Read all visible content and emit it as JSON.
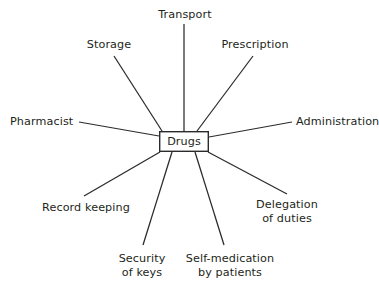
{
  "diagram": {
    "type": "spider-diagram",
    "title": "Drugs",
    "background_color": "#ffffff",
    "line_color": "#2b2b2b",
    "text_color": "#231f20",
    "center": {
      "label": "Drugs",
      "shape": "rectangle",
      "box": {
        "x": 159,
        "y": 131,
        "width": 50,
        "height": 21
      }
    },
    "spokes": [
      {
        "id": "transport",
        "label": "Transport",
        "lines": [
          "Transport"
        ],
        "direction": "top",
        "label_pos": {
          "x": 155,
          "y": 8,
          "width": 60,
          "align": "center"
        },
        "connector": {
          "x1": 184,
          "y1": 24,
          "x2": 184,
          "y2": 131
        }
      },
      {
        "id": "storage",
        "label": "Storage",
        "lines": [
          "Storage"
        ],
        "direction": "top-left",
        "label_pos": {
          "x": 83,
          "y": 38,
          "width": 52,
          "align": "center"
        },
        "connector": {
          "x1": 114,
          "y1": 56,
          "x2": 162,
          "y2": 131
        }
      },
      {
        "id": "prescription",
        "label": "Prescription",
        "lines": [
          "Prescription"
        ],
        "direction": "top-right",
        "label_pos": {
          "x": 219,
          "y": 38,
          "width": 72,
          "align": "center"
        },
        "connector": {
          "x1": 253,
          "y1": 56,
          "x2": 197,
          "y2": 131
        }
      },
      {
        "id": "pharmacist",
        "label": "Pharmacist",
        "lines": [
          "Pharmacist"
        ],
        "direction": "left",
        "label_pos": {
          "x": 10,
          "y": 115,
          "width": 66,
          "align": "left"
        },
        "connector": {
          "x1": 79,
          "y1": 122,
          "x2": 159,
          "y2": 136
        }
      },
      {
        "id": "administration",
        "label": "Administration",
        "lines": [
          "Administration"
        ],
        "direction": "right",
        "label_pos": {
          "x": 296,
          "y": 115,
          "width": 84,
          "align": "left"
        },
        "connector": {
          "x1": 292,
          "y1": 122,
          "x2": 209,
          "y2": 137
        }
      },
      {
        "id": "record-keeping",
        "label": "Record keeping",
        "lines": [
          "Record keeping"
        ],
        "direction": "bottom-left",
        "label_pos": {
          "x": 40,
          "y": 201,
          "width": 92,
          "align": "center"
        },
        "connector": {
          "x1": 84,
          "y1": 196,
          "x2": 160,
          "y2": 152
        }
      },
      {
        "id": "delegation-of-duties",
        "label": "Delegation of duties",
        "lines": [
          "Delegation",
          "of duties"
        ],
        "direction": "bottom-right",
        "label_pos": {
          "x": 249,
          "y": 198,
          "width": 76,
          "align": "center"
        },
        "connector": {
          "x1": 287,
          "y1": 194,
          "x2": 208,
          "y2": 152
        }
      },
      {
        "id": "security-of-keys",
        "label": "Security of keys",
        "lines": [
          "Security",
          "of keys"
        ],
        "direction": "bottom",
        "label_pos": {
          "x": 113,
          "y": 252,
          "width": 58,
          "align": "center"
        },
        "connector": {
          "x1": 143,
          "y1": 245,
          "x2": 172,
          "y2": 152
        }
      },
      {
        "id": "self-medication-by-patients",
        "label": "Self-medication by patients",
        "lines": [
          "Self-medication",
          "by patients"
        ],
        "direction": "bottom",
        "label_pos": {
          "x": 182,
          "y": 252,
          "width": 96,
          "align": "center"
        },
        "connector": {
          "x1": 224,
          "y1": 245,
          "x2": 195,
          "y2": 152
        }
      }
    ]
  }
}
